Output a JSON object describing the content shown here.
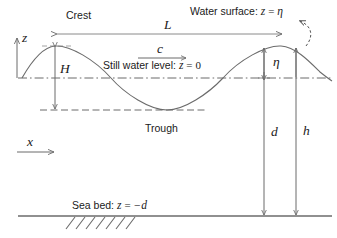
{
  "figure": {
    "kind": "wave-definition-sketch",
    "background_color": "#ffffff",
    "line_color": "#6b6b6b",
    "text_color": "#1a1a1a"
  },
  "labels": {
    "crest": "Crest",
    "trough": "Trough",
    "wavelength": "L",
    "celerity": "c",
    "wave_height": "H",
    "eta": "η",
    "depth_still": "d",
    "depth_total": "h",
    "axis_z": "z",
    "axis_x": "x",
    "water_surface_prefix": "Water surface:",
    "water_surface_var": "z",
    "water_surface_eq": "=",
    "water_surface_val": "η",
    "still_water_prefix": "Still water level:",
    "still_water_var": "z",
    "still_water_eq": "=",
    "still_water_val": "0",
    "sea_bed_prefix": "Sea bed:",
    "sea_bed_var": "z",
    "sea_bed_eq": "=",
    "sea_bed_val": "−d"
  },
  "geometry": {
    "still_water_level_y": 78,
    "crest_y": 46,
    "trough_y": 110,
    "sea_bed_y": 216,
    "wave_start_x": 22,
    "wave_end_x": 332,
    "wavelength_px": 225,
    "amplitude_px": 32,
    "d_arrow_x": 264,
    "h_arrow_x": 296,
    "H_arrow_x": 55,
    "L_arrow_y": 34,
    "L_arrow_x1": 57,
    "L_arrow_x2": 282,
    "c_arrow_y": 58,
    "c_arrow_x1": 138,
    "c_arrow_x2": 186,
    "hatch_count": 7,
    "hatch_x_start": 66,
    "hatch_spacing": 10
  },
  "icons": {
    "z_axis": "up-arrow-icon",
    "x_axis": "right-arrow-icon",
    "pointer": "curved-dashed-arrow-icon"
  }
}
